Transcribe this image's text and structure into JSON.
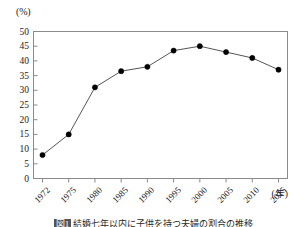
{
  "figure": {
    "unit_label": "(%)",
    "xaxis_unit": "(年)",
    "caption_label": "図1",
    "caption_text": "結婚七年以内に子供を持つ夫婦の割合の推移"
  },
  "chart_data": {
    "type": "line",
    "title": "",
    "xlabel": "(年)",
    "ylabel": "(%)",
    "ylim": [
      0,
      50
    ],
    "ytick_step": 5,
    "grid": false,
    "legend": "none",
    "marker": "filled-circle",
    "line_color": "#555555",
    "marker_color": "#000000",
    "categories": [
      "1972",
      "1975",
      "1980",
      "1985",
      "1990",
      "1995",
      "2000",
      "2005",
      "2010",
      "2015"
    ],
    "values": [
      8,
      15,
      31,
      36.5,
      38,
      43.5,
      45,
      43,
      41,
      37
    ],
    "ytick_labels": [
      "50",
      "45",
      "40",
      "35",
      "30",
      "25",
      "20",
      "15",
      "10",
      "5",
      "0"
    ],
    "ytick_values": [
      50,
      45,
      40,
      35,
      30,
      25,
      20,
      15,
      10,
      5,
      0
    ]
  }
}
